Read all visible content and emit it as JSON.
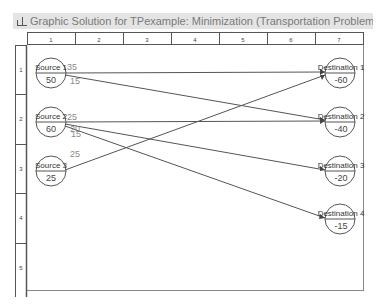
{
  "window": {
    "title": "Graphic Solution for TPexample: Minimization (Transportation Problem)",
    "icon": "chart-icon"
  },
  "grid": {
    "columns": [
      "1",
      "2",
      "3",
      "4",
      "5",
      "6",
      "7"
    ],
    "rows": [
      "1",
      "2",
      "3",
      "4",
      "5"
    ]
  },
  "sources": [
    {
      "label": "Source 1",
      "value": "50"
    },
    {
      "label": "Source 2",
      "value": "60"
    },
    {
      "label": "Source 3",
      "value": "25"
    }
  ],
  "destinations": [
    {
      "label": "Destination 1",
      "value": "-60"
    },
    {
      "label": "Destination 2",
      "value": "-40"
    },
    {
      "label": "Destination 3",
      "value": "-20"
    },
    {
      "label": "Destination 4",
      "value": "-15"
    }
  ],
  "flows": [
    {
      "from": "Source 1",
      "to": "Destination 1",
      "amount": "35"
    },
    {
      "from": "Source 1",
      "to": "Destination 2",
      "amount": "15"
    },
    {
      "from": "Source 2",
      "to": "Destination 2",
      "amount": "25"
    },
    {
      "from": "Source 2",
      "to": "Destination 3",
      "amount": "20"
    },
    {
      "from": "Source 2",
      "to": "Destination 4",
      "amount": "15"
    },
    {
      "from": "Source 3",
      "to": "Destination 1",
      "amount": "25"
    }
  ],
  "colors": {
    "line": "#555555",
    "text": "#333333",
    "faint_text": "#8a8a8a",
    "titlebar_bg": "#e4e4e4"
  }
}
